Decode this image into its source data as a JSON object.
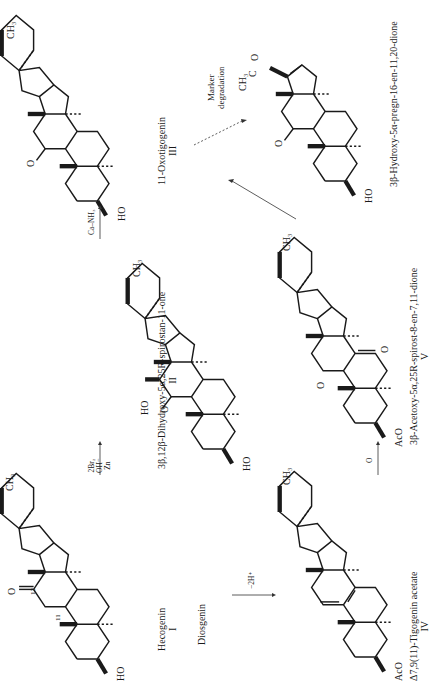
{
  "figure": {
    "orientation": "rotated-90-ccw",
    "compounds": [
      {
        "id": "I",
        "name": "Hecogenin",
        "numeral": "I",
        "locants": [
          "11",
          "12"
        ]
      },
      {
        "id": "II",
        "name": "3β,12β-Dihydroxy-5α,25R-spirostan-11-one",
        "numeral": "II"
      },
      {
        "id": "III",
        "name": "11-Oxotigogenin",
        "numeral": "III"
      },
      {
        "id": "IV",
        "name": "Δ7,9(11)-Tigogenin acetate",
        "numeral": "IV"
      },
      {
        "id": "V",
        "name": "3β-Acetoxy-5α,25R-spirost-8-en-7,11-dione",
        "numeral": "V"
      },
      {
        "id": "VI",
        "name": "3β-Hydroxy-5α-pregn-16-en-11,20-dione",
        "numeral": ""
      }
    ],
    "start_material": "Diosgenin",
    "reactions": [
      {
        "from": "I",
        "to": "II",
        "reagents": [
          "2Br₂",
          "OH⁻",
          "Zn"
        ]
      },
      {
        "from": "II",
        "to": "III",
        "reagents": [
          "Ca–NH₃"
        ]
      },
      {
        "from": "Diosgenin",
        "to": "IV",
        "reagents": [
          "−2H⁺"
        ]
      },
      {
        "from": "IV",
        "to": "V",
        "reagents": [
          "O"
        ]
      },
      {
        "from": "V",
        "to": "III",
        "reagents": []
      },
      {
        "from": "III",
        "to": "VI",
        "reagents": [
          "Marker",
          "degradation"
        ],
        "style": "dashed"
      }
    ],
    "atom_labels": {
      "ch3": "CH₃",
      "h3c": "H₃C",
      "h": "H",
      "o": "O",
      "ho": "HO",
      "aco": "AcO",
      "c": "C"
    }
  }
}
